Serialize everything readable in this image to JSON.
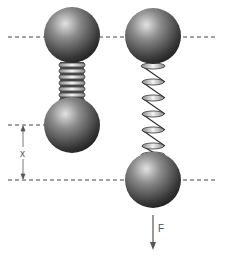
{
  "diagram": {
    "labels": {
      "displacement": "x",
      "force": "F"
    },
    "colors": {
      "ball_dark": "#2a2a2a",
      "ball_mid": "#6e6e6e",
      "ball_light": "#d8d8d8",
      "coil_fill": "#e6e6e6",
      "coil_stroke": "#333333",
      "dashed_line": "#444444",
      "arrow": "#555555"
    },
    "systems": [
      {
        "name": "compressed",
        "spring_coils": 7
      },
      {
        "name": "stretched",
        "spring_coils": 6
      }
    ]
  }
}
